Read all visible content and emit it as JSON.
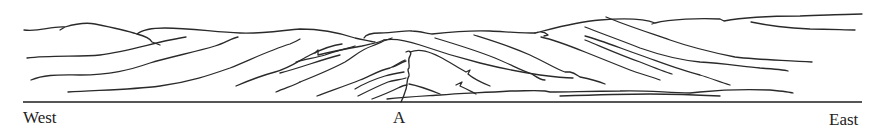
{
  "figure": {
    "title": "",
    "labels": {
      "west": "West",
      "a": "A",
      "east": "East"
    },
    "colors": {
      "background": "#ffffff",
      "ink": "#2a2a2a"
    },
    "baseline": {
      "x1": 23,
      "y1": 102,
      "x2": 862,
      "y2": 102
    },
    "paths": [
      {
        "id": "skyline-west",
        "d": "M24 30 C40 32 50 26 65 27 L60 30 M65 27 C75 24 85 22 95 24 C110 27 125 30 137 34 C145 36 150 38 152 42 L160 45"
      },
      {
        "id": "skyline-west-2",
        "d": "M137 34 C142 30 150 28 165 28 C190 28 215 32 240 33 C262 34 285 30 300 29 C320 29 340 33 355 38 C365 40 372 42 375 42"
      },
      {
        "id": "skyline-center",
        "d": "M364 38 C366 34 372 33 380 33 C395 33 405 30 412 31 C420 31 428 34 432 34 C450 32 470 30 490 31 C510 32 525 33 535 33"
      },
      {
        "id": "skyline-east",
        "d": "M535 33 C540 31 545 32 548 35 L544 36 M535 33 C555 28 575 22 600 20 C625 18 645 19 655 23 L652 24 M655 23 C670 19 700 18 720 19 L724 21 M724 21 C740 18 770 16 800 16 C830 15 850 14 862 14"
      },
      {
        "id": "layer-w1",
        "d": "M27 58 C50 55 80 57 100 55 C125 52 150 44 170 40 C180 38 185 37 186 37"
      },
      {
        "id": "layer-w2",
        "d": "M31 80 C45 74 60 75 80 75 C110 75 130 70 150 63 C170 57 195 52 215 46 C225 43 232 38 238 37"
      },
      {
        "id": "layer-w3",
        "d": "M68 92 C95 90 130 90 160 86 C190 82 210 75 230 68 C250 60 270 50 290 44 C297 41 300 39 300 39"
      },
      {
        "id": "layer-w4",
        "d": "M236 86 C250 80 260 76 275 72 C290 68 300 60 310 55 C320 50 333 45 342 44"
      },
      {
        "id": "layer-w5",
        "d": "M276 92 C285 88 295 85 300 82"
      },
      {
        "id": "layer-c1",
        "d": "M300 82 C315 76 330 70 345 62 C355 56 360 50 372 46 C380 43 385 40 392 38"
      },
      {
        "id": "layer-c2",
        "d": "M296 62 C305 59 315 58 325 55 C335 51 345 49 355 46"
      },
      {
        "id": "layer-c3",
        "d": "M315 53 L318 50 L318 55 C330 52 345 49 362 46 C370 44 378 43 384 40"
      },
      {
        "id": "layer-c4",
        "d": "M280 73 C300 68 320 60 340 55"
      },
      {
        "id": "layer-c5",
        "d": "M317 96 C330 91 345 86 360 80 C370 76 380 70 390 68 C395 66 400 62 405 60"
      },
      {
        "id": "fold-axis",
        "d": "M406 52 C410 50 412 52 410 56 C407 60 410 64 409 68 C406 70 410 73 409 76 C406 80 408 86 405 92 C404 96 402 100 401 102"
      },
      {
        "id": "fold-limb-w1",
        "d": "M355 89 C365 83 375 79 385 76 C392 74 398 73 404 72"
      },
      {
        "id": "fold-limb-w2",
        "d": "M358 96 C368 91 378 86 388 82 C394 80 400 80 406 78"
      },
      {
        "id": "fold-limb-w3",
        "d": "M372 99 C380 96 390 92 398 88 C402 86 405 85 407 85"
      },
      {
        "id": "fold-limb-w4",
        "d": "M393 67 C398 65 402 62 406 61"
      },
      {
        "id": "fold-crest",
        "d": "M410 52 C420 48 430 52 440 57 C450 62 458 68 466 72 L470 70 L468 74 C475 80 485 84 490 86"
      },
      {
        "id": "fold-limb-e1",
        "d": "M409 84 C420 86 430 90 440 94"
      },
      {
        "id": "fold-limb-e2",
        "d": "M456 85 L462 82 L460 86 C467 89 472 92 476 94"
      },
      {
        "id": "layer-e0",
        "d": "M384 40 C395 38 405 40 420 45 C440 52 460 58 480 63 C500 68 520 72 540 75 C555 77 568 78 573 78"
      },
      {
        "id": "layer-e1",
        "d": "M474 35 C490 40 510 46 530 55 C545 62 558 70 565 72 L570 72 C575 73 578 76 580 77 M580 77 C590 79 600 82 605 84"
      },
      {
        "id": "layer-e2",
        "d": "M435 38 C455 44 475 50 495 58 C510 64 520 70 532 74 C535 76 540 80 545 80"
      },
      {
        "id": "layer-e3",
        "d": "M541 37 C555 40 570 46 585 52 C600 58 615 64 630 70 C640 74 650 76 660 80"
      },
      {
        "id": "layer-e4",
        "d": "M585 36 C600 40 620 48 640 55 C660 62 680 70 700 75 C710 78 720 82 730 85"
      },
      {
        "id": "layer-e5",
        "d": "M606 17 C625 25 650 33 670 40 C690 47 710 52 735 57 C760 60 785 60 812 62"
      },
      {
        "id": "layer-e6",
        "d": "M585 27 C600 33 620 40 640 48 C660 55 680 60 700 62 C720 63 740 66 760 68 C775 69 785 70 788 71"
      },
      {
        "id": "layer-e7",
        "d": "M585 40 C600 46 620 55 640 62 C655 68 665 72 672 74"
      },
      {
        "id": "layer-e8",
        "d": "M751 22 C770 26 790 28 810 29 C830 29 845 30 855 30"
      },
      {
        "id": "layer-lower",
        "d": "M387 99 C405 97 425 96 440 95 C460 93 480 93 510 91 C525 91 535 90 545 91 L550 92 C570 92 590 91 620 91 C640 90 660 92 690 93 L700 92 C720 90 745 89 770 90 C780 91 790 92 793 93"
      },
      {
        "id": "layer-lower-2",
        "d": "M560 96 C590 95 620 94 650 94 C680 94 700 95 720 96"
      }
    ]
  }
}
